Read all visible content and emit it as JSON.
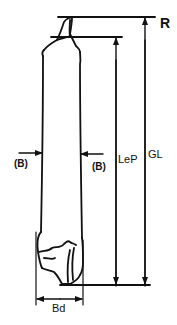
{
  "diagram": {
    "line_color": "#111111",
    "background": "#ffffff",
    "labels": {
      "reference": "R",
      "breadth_left": "(B)",
      "breadth_right": "(B)",
      "lateral_length": "LeP",
      "greatest_length": "GL",
      "distal_breadth": "Bd"
    },
    "measurements": [
      {
        "id": "GL",
        "meaning": "greatest length",
        "orientation": "vertical",
        "from": "R line (top)",
        "to": "distal baseline"
      },
      {
        "id": "LeP",
        "meaning": "length (lateral)",
        "orientation": "vertical",
        "from": "second top line",
        "to": "distal baseline"
      },
      {
        "id": "(B)",
        "meaning": "shaft breadth",
        "orientation": "horizontal",
        "position": "mid-shaft"
      },
      {
        "id": "Bd",
        "meaning": "distal breadth",
        "orientation": "horizontal",
        "position": "distal end"
      }
    ]
  }
}
